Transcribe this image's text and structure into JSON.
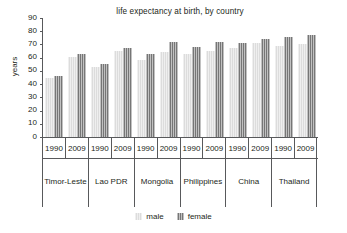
{
  "chart_data": {
    "type": "bar",
    "title": "life expectancy at birth, by country",
    "xlabel": "",
    "ylabel": "years",
    "ylim": [
      0,
      90
    ],
    "yticks": [
      0,
      10,
      20,
      30,
      40,
      50,
      60,
      70,
      80,
      90
    ],
    "grid": false,
    "legend_position": "bottom-center",
    "categories": [
      "Timor-Leste 1990",
      "Timor-Leste 2009",
      "Lao PDR 1990",
      "Lao PDR 2009",
      "Mongolia 1990",
      "Mongolia 2009",
      "Philippines 1990",
      "Philippines 2009",
      "China 1990",
      "China 2009",
      "Thailand 1990",
      "Thailand 2009"
    ],
    "countries": [
      "Timor-Leste",
      "Lao PDR",
      "Mongolia",
      "Philippines",
      "China",
      "Thailand"
    ],
    "years": [
      "1990",
      "2009"
    ],
    "series": [
      {
        "name": "male",
        "color": "#dcdcdc",
        "values": [
          44.5,
          60.5,
          53,
          65,
          58,
          64,
          62.5,
          65,
          67.5,
          71,
          69,
          70
        ]
      },
      {
        "name": "female",
        "color": "#767676",
        "values": [
          46.5,
          62.5,
          55.5,
          67.5,
          63,
          72,
          68,
          71.5,
          71,
          74.5,
          75.5,
          77
        ]
      }
    ],
    "groups": [
      {
        "country": "Timor-Leste",
        "periods": [
          {
            "year": "1990",
            "male": 44.5,
            "female": 46.5
          },
          {
            "year": "2009",
            "male": 60.5,
            "female": 62.5
          }
        ]
      },
      {
        "country": "Lao PDR",
        "periods": [
          {
            "year": "1990",
            "male": 53,
            "female": 55.5
          },
          {
            "year": "2009",
            "male": 65,
            "female": 67.5
          }
        ]
      },
      {
        "country": "Mongolia",
        "periods": [
          {
            "year": "1990",
            "male": 58,
            "female": 63
          },
          {
            "year": "2009",
            "male": 64,
            "female": 72
          }
        ]
      },
      {
        "country": "Philippines",
        "periods": [
          {
            "year": "1990",
            "male": 62.5,
            "female": 68
          },
          {
            "year": "2009",
            "male": 65,
            "female": 71.5
          }
        ]
      },
      {
        "country": "China",
        "periods": [
          {
            "year": "1990",
            "male": 67.5,
            "female": 71
          },
          {
            "year": "2009",
            "male": 71,
            "female": 74.5
          }
        ]
      },
      {
        "country": "Thailand",
        "periods": [
          {
            "year": "1990",
            "male": 69,
            "female": 75.5
          },
          {
            "year": "2009",
            "male": 70,
            "female": 77
          }
        ]
      }
    ],
    "legend": [
      {
        "label": "male",
        "color": "#dcdcdc"
      },
      {
        "label": "female",
        "color": "#767676"
      }
    ]
  }
}
